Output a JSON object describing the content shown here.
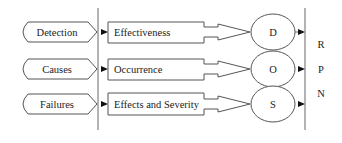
{
  "diagram": {
    "inputs": [
      {
        "label": "Detection"
      },
      {
        "label": "Causes"
      },
      {
        "label": "Failures"
      }
    ],
    "factors": [
      {
        "label": "Effectiveness"
      },
      {
        "label": "Occurrence"
      },
      {
        "label": "Effects and Severity"
      }
    ],
    "ratings": [
      {
        "label": "D"
      },
      {
        "label": "O"
      },
      {
        "label": "S"
      }
    ],
    "output": {
      "letters": [
        "R",
        "P",
        "N"
      ]
    },
    "colors": {
      "stroke": "#555555",
      "arrow": "#111111",
      "background": "#ffffff"
    }
  }
}
